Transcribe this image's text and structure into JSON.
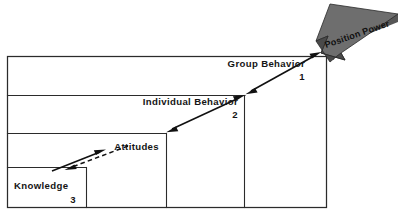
{
  "figure": {
    "type": "staircase-diagram",
    "title_visible": false,
    "background_color": "#ffffff",
    "line_color": "#2b2b2b",
    "banner_color": "#6e6e6e",
    "banner_dark_color": "#4a4a4a",
    "text_color": "#151515"
  },
  "banner": {
    "label": "Position Power",
    "direction": "down-left",
    "shape": "3d-block-arrow"
  },
  "steps": [
    {
      "id": "group-behavior",
      "label": "Group Behavior",
      "number": "1",
      "level": 4
    },
    {
      "id": "individual-behavior",
      "label": "Individual Behavior",
      "number": "2",
      "level": 3
    },
    {
      "id": "attitudes",
      "label": "Attitudes",
      "number": "",
      "level": 2
    },
    {
      "id": "knowledge",
      "label": "Knowledge",
      "number": "3",
      "level": 1
    }
  ],
  "arrows": [
    {
      "id": "arrow-group",
      "style": "solid",
      "heads": "both",
      "from": "individual-behavior-corner",
      "to": "position-power-banner"
    },
    {
      "id": "arrow-individual",
      "style": "solid",
      "heads": "both",
      "from": "attitudes-corner",
      "to": "group-behavior-corner"
    },
    {
      "id": "arrow-attitudes-solid",
      "style": "solid",
      "heads": "up-right",
      "from": "knowledge-corner",
      "to": "attitudes-corner"
    },
    {
      "id": "arrow-attitudes-dashed",
      "style": "dashed",
      "heads": "down-left",
      "from": "attitudes-corner",
      "to": "knowledge-corner"
    }
  ]
}
